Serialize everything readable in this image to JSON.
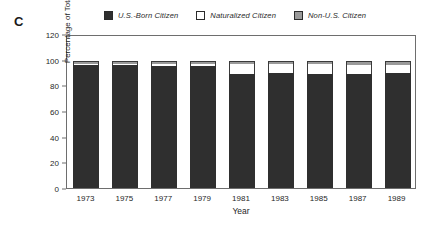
{
  "panel": {
    "label": "C"
  },
  "legend": {
    "items": [
      {
        "label": "U.S.-Born Citizen",
        "swatch": "dark-swatch-icon",
        "color": "#2f2f2f"
      },
      {
        "label": "Naturalized Citizen",
        "swatch": "white-swatch-icon",
        "color": "#ffffff"
      },
      {
        "label": "Non-U.S. Citizen",
        "swatch": "gray-swatch-icon",
        "color": "#9a9a9a"
      }
    ]
  },
  "chart_data": {
    "type": "bar",
    "title": "",
    "xlabel": "Year",
    "ylabel": "Percentage of Total Field",
    "categories": [
      "1973",
      "1975",
      "1977",
      "1979",
      "1981",
      "1983",
      "1985",
      "1987",
      "1989"
    ],
    "yticks": [
      0,
      20,
      40,
      60,
      80,
      100,
      120
    ],
    "ylim": [
      0,
      120
    ],
    "grid": false,
    "stacked": true,
    "legend_position": "top",
    "series": [
      {
        "name": "U.S.-Born Citizen",
        "color": "#2f2f2f",
        "values": [
          96,
          96,
          95,
          95,
          89,
          90,
          89,
          89,
          90
        ]
      },
      {
        "name": "Naturalized Citizen",
        "color": "#ffffff",
        "values": [
          1,
          1,
          2,
          2,
          8,
          7,
          8,
          7,
          6
        ]
      },
      {
        "name": "Non-U.S. Citizen",
        "color": "#9a9a9a",
        "values": [
          2,
          2,
          2,
          2,
          2,
          2,
          2,
          3,
          3
        ]
      }
    ],
    "totals": [
      99,
      99,
      99,
      99,
      99,
      99,
      99,
      99,
      99
    ]
  }
}
